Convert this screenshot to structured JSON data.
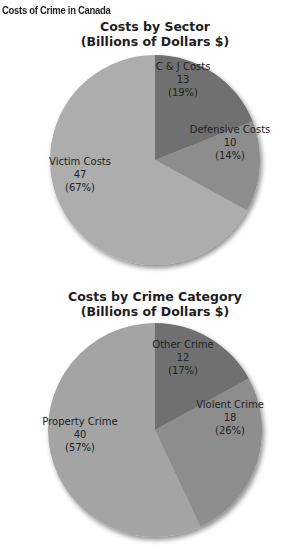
{
  "page": {
    "title": "Costs of Crime in Canada"
  },
  "chart_data": [
    {
      "type": "pie",
      "title": "Costs by Sector",
      "subtitle": "(Billions of Dollars $)",
      "unit": "Billions of Dollars $",
      "start_angle": "12 o'clock, clockwise",
      "slices": [
        {
          "label": "C & J Costs",
          "value": 13,
          "percent": 19,
          "value_text": "13",
          "percent_text": "(19%)",
          "color": "#6f6f6f"
        },
        {
          "label": "Defensive Costs",
          "value": 10,
          "percent": 14,
          "value_text": "10",
          "percent_text": "(14%)",
          "color": "#8d8d8d"
        },
        {
          "label": "Victim Costs",
          "value": 47,
          "percent": 67,
          "value_text": "47",
          "percent_text": "(67%)",
          "color": "#adadad"
        }
      ]
    },
    {
      "type": "pie",
      "title": "Costs by Crime Category",
      "subtitle": "(Billions of Dollars $)",
      "unit": "Billions of Dollars $",
      "start_angle": "12 o'clock, clockwise",
      "slices": [
        {
          "label": "Other Crime",
          "value": 12,
          "percent": 17,
          "value_text": "12",
          "percent_text": "(17%)",
          "color": "#6f6f6f"
        },
        {
          "label": "Violent Crime",
          "value": 18,
          "percent": 26,
          "value_text": "18",
          "percent_text": "(26%)",
          "color": "#8d8d8d"
        },
        {
          "label": "Property Crime",
          "value": 40,
          "percent": 57,
          "value_text": "40",
          "percent_text": "(57%)",
          "color": "#a4a4a4"
        }
      ]
    }
  ]
}
